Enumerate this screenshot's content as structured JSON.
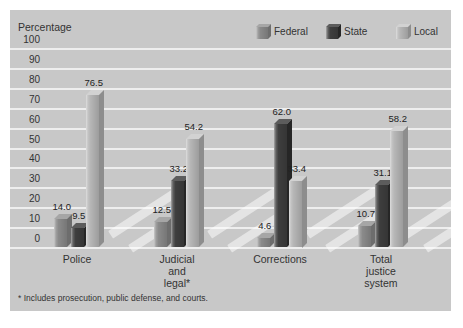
{
  "figure": {
    "axis_title": "Percentage",
    "footnote": "* Includes prosecution, public defense, and courts."
  },
  "colors": {
    "page_bg": "#ffffff",
    "panel_bg": "#c8c8c8",
    "gridline": "#eeeeee",
    "text": "#333333",
    "stripe": "rgba(255,255,255,0.5)"
  },
  "chart_data": {
    "type": "bar",
    "title": "",
    "xlabel": "",
    "ylabel": "Percentage",
    "ylim": [
      0,
      100
    ],
    "yticks": [
      0,
      10,
      20,
      30,
      40,
      50,
      60,
      70,
      80,
      90,
      100
    ],
    "grid": "horizontal",
    "legend_position": "top-right",
    "style": "3d-grouped-bars",
    "categories": [
      "Police",
      "Judicial\nand\nlegal*",
      "Corrections",
      "Total\njustice\nsystem"
    ],
    "series": [
      {
        "name": "Federal",
        "values": [
          14.0,
          12.5,
          4.6,
          10.7
        ],
        "color": "#8a8a8a",
        "color_side": "#6d6d6d",
        "color_top": "#a6a6a6"
      },
      {
        "name": "State",
        "values": [
          9.5,
          33.2,
          62.0,
          31.1
        ],
        "color": "#3e3e3e",
        "color_side": "#262626",
        "color_top": "#5c5c5c"
      },
      {
        "name": "Local",
        "values": [
          76.5,
          54.2,
          33.4,
          58.2
        ],
        "color": "#b6b6b6",
        "color_side": "#8d8d8d",
        "color_top": "#d2d2d2"
      }
    ],
    "value_labels": [
      [
        "14.0",
        "9.5",
        "76.5"
      ],
      [
        "12.5",
        "33.2",
        "54.2"
      ],
      [
        "4.6",
        "62.0",
        "33.4"
      ],
      [
        "10.7",
        "31.1",
        "58.2"
      ]
    ],
    "footnote": "* Includes prosecution, public defense, and courts."
  }
}
